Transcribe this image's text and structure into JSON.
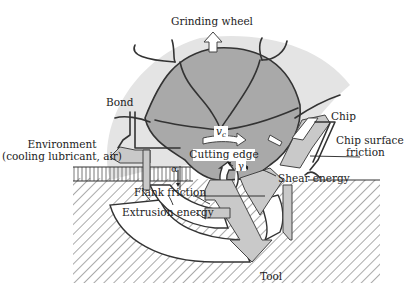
{
  "figure": {
    "type": "schematic",
    "colors": {
      "grain_fill": "#a9a9a9",
      "halo_fill": "#e4e4e4",
      "arrow_fill": "#c9c9c9",
      "outline": "#333333",
      "background": "#ffffff"
    }
  },
  "labels": {
    "grinding_wheel": "Grinding wheel",
    "bond": "Bond",
    "environment_line1": "Environment",
    "environment_line2": "(cooling lubricant, air)",
    "chip": "Chip",
    "chip_surface_friction_line1": "Chip surface",
    "chip_surface_friction_line2": "friction",
    "cutting_speed_symbol": "v",
    "cutting_speed_subscript": "c",
    "cutting_edge": "Cutting edge",
    "rake_angle_symbol": "γ",
    "clearance_angle_symbol": "α",
    "shear_energy": "Shear energy",
    "flank_friction": "Flank friction",
    "extrusion_energy": "Extrusion energy",
    "tool": "Tool"
  }
}
